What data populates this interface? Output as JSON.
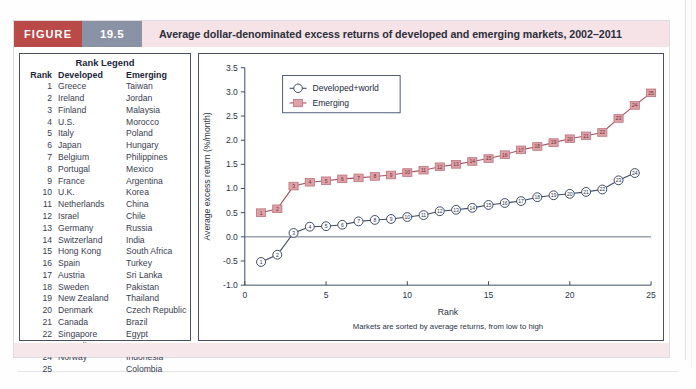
{
  "figure": {
    "tag": "FIGURE",
    "number": "19.5",
    "title": "Average dollar-denominated excess returns of developed and emerging markets, 2002–2011"
  },
  "legend_table": {
    "title": "Rank Legend",
    "columns": [
      "Rank",
      "Developed",
      "Emerging"
    ],
    "rows": [
      [
        "1",
        "Greece",
        "Taiwan"
      ],
      [
        "2",
        "Ireland",
        "Jordan"
      ],
      [
        "3",
        "Finland",
        "Malaysia"
      ],
      [
        "4",
        "U.S.",
        "Morocco"
      ],
      [
        "5",
        "Italy",
        "Poland"
      ],
      [
        "6",
        "Japan",
        "Hungary"
      ],
      [
        "7",
        "Belgium",
        "Philippines"
      ],
      [
        "8",
        "Portugal",
        "Mexico"
      ],
      [
        "9",
        "France",
        "Argentina"
      ],
      [
        "10",
        "U.K.",
        "Korea"
      ],
      [
        "11",
        "Netherlands",
        "China"
      ],
      [
        "12",
        "Israel",
        "Chile"
      ],
      [
        "13",
        "Germany",
        "Russia"
      ],
      [
        "14",
        "Switzerland",
        "India"
      ],
      [
        "15",
        "Hong Kong",
        "South Africa"
      ],
      [
        "16",
        "Spain",
        "Turkey"
      ],
      [
        "17",
        "Austria",
        "Sri Lanka"
      ],
      [
        "18",
        "Sweden",
        "Pakistan"
      ],
      [
        "19",
        "New Zealand",
        "Thailand"
      ],
      [
        "20",
        "Denmark",
        "Czech Republic"
      ],
      [
        "21",
        "Canada",
        "Brazil"
      ],
      [
        "22",
        "Singapore",
        "Egypt"
      ],
      [
        "23",
        "Australia",
        "Peru"
      ],
      [
        "24",
        "Norway",
        "Indonesia"
      ],
      [
        "25",
        "",
        "Colombia"
      ]
    ]
  },
  "chart_data": {
    "type": "line",
    "title": "",
    "xlabel": "Rank",
    "ylabel": "Average excess return (%/month)",
    "annotation": "Markets are sorted by average returns, from low to high",
    "xlim": [
      0,
      25
    ],
    "ylim": [
      -1.0,
      3.5
    ],
    "xticks": [
      0,
      5,
      10,
      15,
      20,
      25
    ],
    "yticks": [
      -1.0,
      -0.5,
      0.0,
      0.5,
      1.0,
      1.5,
      2.0,
      2.5,
      3.0,
      3.5
    ],
    "ytick_labels": [
      "-1.0",
      "-0.5",
      "0.0",
      "0.5",
      "1.0",
      "1.5",
      "2.0",
      "2.5",
      "3.0",
      "3.5"
    ],
    "grid": false,
    "legend_position": "upper-left",
    "series": [
      {
        "name": "Developed+world",
        "marker": "circle",
        "color": "#3c4766",
        "x": [
          1,
          2,
          3,
          4,
          5,
          6,
          7,
          8,
          9,
          10,
          11,
          12,
          13,
          14,
          15,
          16,
          17,
          18,
          19,
          20,
          21,
          22,
          23,
          24
        ],
        "values": [
          -0.52,
          -0.37,
          0.08,
          0.21,
          0.22,
          0.25,
          0.32,
          0.35,
          0.37,
          0.41,
          0.45,
          0.53,
          0.56,
          0.6,
          0.66,
          0.7,
          0.74,
          0.82,
          0.86,
          0.89,
          0.93,
          0.98,
          1.17,
          1.32
        ]
      },
      {
        "name": "Emerging",
        "marker": "square",
        "color": "#b8737c",
        "x": [
          1,
          2,
          3,
          4,
          5,
          6,
          7,
          8,
          9,
          10,
          11,
          12,
          13,
          14,
          15,
          16,
          17,
          18,
          19,
          20,
          21,
          22,
          23,
          24,
          25
        ],
        "values": [
          0.5,
          0.58,
          1.05,
          1.13,
          1.16,
          1.2,
          1.22,
          1.25,
          1.28,
          1.33,
          1.38,
          1.45,
          1.5,
          1.56,
          1.62,
          1.7,
          1.8,
          1.87,
          1.95,
          2.03,
          2.09,
          2.16,
          2.45,
          2.72,
          2.98
        ]
      }
    ]
  }
}
